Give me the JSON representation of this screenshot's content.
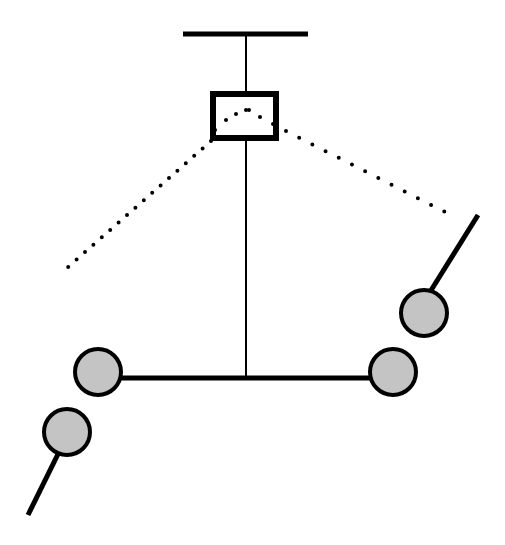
{
  "diagram": {
    "title": "",
    "background": "#ffffff",
    "stroke_color": "#000000",
    "fill_color": "#c4c4c4",
    "elements": {
      "mount_bar": {
        "x1": 183,
        "y1": 34,
        "x2": 308,
        "y2": 34,
        "width": 5
      },
      "suspension_rod_upper": {
        "x1": 246,
        "y1": 34,
        "x2": 246,
        "y2": 93,
        "width": 2
      },
      "sensor_box": {
        "x": 213,
        "y": 94,
        "w": 63,
        "h": 44,
        "width": 6
      },
      "suspension_rod_lower": {
        "x1": 246,
        "y1": 138,
        "x2": 246,
        "y2": 378,
        "width": 2
      },
      "crossbar": {
        "x1": 120,
        "y1": 378,
        "x2": 372,
        "y2": 378,
        "width": 5
      },
      "dotted_arc": [
        [
          225,
          118
        ],
        [
          236,
          111
        ],
        [
          246,
          109
        ],
        [
          258,
          111
        ],
        [
          269,
          118
        ]
      ],
      "dotted_line_left": {
        "x1": 210,
        "y1": 140,
        "x2": 67,
        "y2": 268
      },
      "dotted_line_right": {
        "x1": 284,
        "y1": 130,
        "x2": 447,
        "y2": 213
      },
      "balls": [
        {
          "name": "ball-left-inner",
          "cx": 98,
          "cy": 372,
          "r": 23
        },
        {
          "name": "ball-right-inner",
          "cx": 393,
          "cy": 372,
          "r": 23
        },
        {
          "name": "ball-left-outer",
          "cx": 67,
          "cy": 432,
          "r": 23
        },
        {
          "name": "ball-right-outer",
          "cx": 424,
          "cy": 313,
          "r": 23
        }
      ],
      "arm_left": {
        "x1": 57,
        "y1": 455,
        "x2": 28,
        "y2": 515,
        "width": 5
      },
      "arm_right": {
        "x1": 434,
        "y1": 290,
        "x2": 478,
        "y2": 215,
        "width": 5
      }
    }
  }
}
